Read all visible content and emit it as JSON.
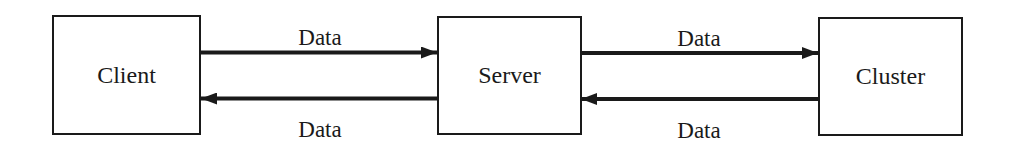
{
  "diagram": {
    "nodes": [
      {
        "id": "client",
        "label": "Client"
      },
      {
        "id": "server",
        "label": "Server"
      },
      {
        "id": "cluster",
        "label": "Cluster"
      }
    ],
    "edges": [
      {
        "from": "client",
        "to": "server",
        "label": "Data",
        "position": "top"
      },
      {
        "from": "server",
        "to": "client",
        "label": "Data",
        "position": "bottom"
      },
      {
        "from": "server",
        "to": "cluster",
        "label": "Data",
        "position": "top"
      },
      {
        "from": "cluster",
        "to": "server",
        "label": "Data",
        "position": "bottom"
      }
    ],
    "colors": {
      "stroke": "#1a1a1a",
      "background": "#ffffff"
    }
  }
}
